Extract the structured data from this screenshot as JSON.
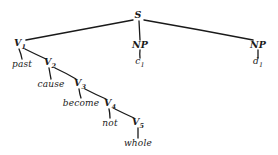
{
  "figure": {
    "type": "syntax-tree",
    "style": "hand-drawn linguistic phrase-structure tree",
    "ink_color": "#1a1a1a",
    "background_color": "#ffffff",
    "width": 278,
    "height": 155
  },
  "nodes": [
    {
      "id": "S",
      "label": "S",
      "sub": "",
      "kind": "category",
      "x": 138,
      "y": 15
    },
    {
      "id": "V1",
      "label": "V",
      "sub": "1",
      "kind": "category",
      "x": 20,
      "y": 44
    },
    {
      "id": "NPc",
      "label": "NP",
      "sub": "",
      "kind": "category",
      "x": 140,
      "y": 45
    },
    {
      "id": "NPd",
      "label": "NP",
      "sub": "",
      "kind": "category",
      "x": 258,
      "y": 45
    },
    {
      "id": "past",
      "label": "past",
      "sub": "",
      "kind": "terminal",
      "x": 22,
      "y": 64
    },
    {
      "id": "V2",
      "label": "V",
      "sub": "2",
      "kind": "category",
      "x": 50,
      "y": 63
    },
    {
      "id": "c1",
      "label": "c",
      "sub": "1",
      "kind": "terminal",
      "x": 140,
      "y": 63
    },
    {
      "id": "d1",
      "label": "d",
      "sub": "1",
      "kind": "terminal",
      "x": 258,
      "y": 63
    },
    {
      "id": "cause",
      "label": "cause",
      "sub": "",
      "kind": "terminal",
      "x": 51,
      "y": 84
    },
    {
      "id": "V3",
      "label": "V",
      "sub": "3",
      "kind": "category",
      "x": 80,
      "y": 84
    },
    {
      "id": "become",
      "label": "become",
      "sub": "",
      "kind": "terminal",
      "x": 81,
      "y": 103
    },
    {
      "id": "V4",
      "label": "V",
      "sub": "4",
      "kind": "category",
      "x": 110,
      "y": 104
    },
    {
      "id": "not",
      "label": "not",
      "sub": "",
      "kind": "terminal",
      "x": 110,
      "y": 123
    },
    {
      "id": "V5",
      "label": "V",
      "sub": "5",
      "kind": "category",
      "x": 138,
      "y": 123
    },
    {
      "id": "whole",
      "label": "whole",
      "sub": "",
      "kind": "terminal",
      "x": 138,
      "y": 143
    }
  ],
  "edges": [
    {
      "from": "S",
      "to": "V1",
      "x1": 133,
      "y1": 20,
      "x2": 26,
      "y2": 40
    },
    {
      "from": "S",
      "to": "NPc",
      "x1": 139,
      "y1": 21,
      "x2": 140,
      "y2": 40
    },
    {
      "from": "S",
      "to": "NPd",
      "x1": 144,
      "y1": 20,
      "x2": 253,
      "y2": 40
    },
    {
      "from": "NPc",
      "to": "c1",
      "x1": 140,
      "y1": 50,
      "x2": 140,
      "y2": 58
    },
    {
      "from": "NPd",
      "to": "d1",
      "x1": 258,
      "y1": 50,
      "x2": 258,
      "y2": 58
    },
    {
      "from": "V1",
      "to": "past",
      "x1": 19,
      "y1": 49,
      "x2": 22,
      "y2": 59
    },
    {
      "from": "V1",
      "to": "V2",
      "x1": 25,
      "y1": 49,
      "x2": 46,
      "y2": 59
    },
    {
      "from": "V2",
      "to": "cause",
      "x1": 49,
      "y1": 68,
      "x2": 51,
      "y2": 79
    },
    {
      "from": "V2",
      "to": "V3",
      "x1": 55,
      "y1": 68,
      "x2": 76,
      "y2": 79
    },
    {
      "from": "V3",
      "to": "become",
      "x1": 79,
      "y1": 89,
      "x2": 81,
      "y2": 98
    },
    {
      "from": "V3",
      "to": "V4",
      "x1": 85,
      "y1": 89,
      "x2": 106,
      "y2": 99
    },
    {
      "from": "V4",
      "to": "not",
      "x1": 109,
      "y1": 109,
      "x2": 110,
      "y2": 118
    },
    {
      "from": "V4",
      "to": "V5",
      "x1": 115,
      "y1": 109,
      "x2": 134,
      "y2": 118
    },
    {
      "from": "V5",
      "to": "whole",
      "x1": 138,
      "y1": 128,
      "x2": 138,
      "y2": 138
    }
  ],
  "chart_data": {
    "type": "tree",
    "title": "",
    "root": "S",
    "structure": "S -> [V1, NP(c1), NP(d1)]; V1 -> [past, V2]; V2 -> [cause, V3]; V3 -> [become, V4]; V4 -> [not, V5]; V5 -> [whole]",
    "categories": [
      "S",
      "V1",
      "V2",
      "V3",
      "V4",
      "V5",
      "NP",
      "NP"
    ],
    "terminals": [
      "past",
      "cause",
      "become",
      "not",
      "whole",
      "c1",
      "d1"
    ]
  }
}
